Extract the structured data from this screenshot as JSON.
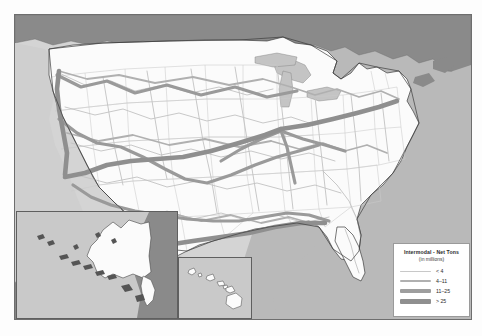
{
  "map": {
    "title": "United States Intermodal Freight Rail Network",
    "regions": {
      "united_states": "United States",
      "canada": "Canada",
      "mexico": "Mexico",
      "ocean": "Ocean"
    },
    "insets": [
      {
        "name": "alaska",
        "label": "Alaska"
      },
      {
        "name": "hawaii",
        "label": "Hawaii"
      }
    ]
  },
  "legend": {
    "title": "Intermodal - Net Tons",
    "subtitle": "(in millions)",
    "items": [
      {
        "label": "< 4",
        "color": "#c8c8c8",
        "width_px": 1
      },
      {
        "label": "4–11",
        "color": "#b0b0b0",
        "width_px": 2
      },
      {
        "label": "11–25",
        "color": "#9e9e9e",
        "width_px": 3.4
      },
      {
        "label": "> 25",
        "color": "#8f8f8f",
        "width_px": 5
      }
    ]
  },
  "colors": {
    "land_us": "#fbfbfb",
    "land_foreign": "#8a8a8a",
    "ocean_light": "#d4d4d4",
    "ocean_dark": "#b9b9b9",
    "great_lakes": "#c4c4c4",
    "state_border": "#c9c9c9",
    "coastline": "#3c3c3c",
    "frame": "#6e6e6e",
    "corridor_heavy": "#8f8f8f",
    "corridor_light": "#c2c2c2"
  }
}
